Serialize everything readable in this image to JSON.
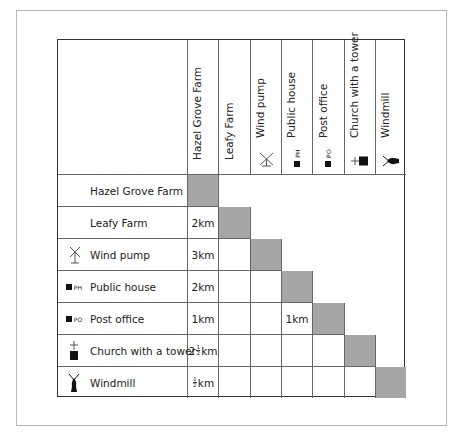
{
  "table": {
    "columns": [
      {
        "label": "Hazel Grove Farm",
        "icon": null
      },
      {
        "label": "Leafy Farm",
        "icon": null
      },
      {
        "label": "Wind pump",
        "icon": "wind-pump-icon"
      },
      {
        "label": "Public house",
        "icon": "public-house-icon",
        "icon_text": "PH"
      },
      {
        "label": "Post office",
        "icon": "post-office-icon",
        "icon_text": "PO"
      },
      {
        "label": "Church with a tower",
        "icon": "church-with-tower-icon"
      },
      {
        "label": "Windmill",
        "icon": "windmill-icon"
      }
    ],
    "rows": [
      {
        "label": "Hazel Grove Farm",
        "icon": null,
        "values": []
      },
      {
        "label": "Leafy Farm",
        "icon": null,
        "values": [
          "2km"
        ]
      },
      {
        "label": "Wind pump",
        "icon": "wind-pump-icon",
        "values": [
          "3km",
          ""
        ]
      },
      {
        "label": "Public house",
        "icon": "public-house-icon",
        "icon_text": "PH",
        "values": [
          "2km",
          "",
          ""
        ]
      },
      {
        "label": "Post office",
        "icon": "post-office-icon",
        "icon_text": "PO",
        "values": [
          "1km",
          "",
          "1km",
          ""
        ]
      },
      {
        "label": "Church with a tower",
        "icon": "church-with-tower-icon",
        "values": [
          "2½km",
          "",
          "",
          "",
          ""
        ]
      },
      {
        "label": "Windmill",
        "icon": "windmill-icon",
        "values": [
          "½km",
          "",
          "",
          "",
          "",
          ""
        ]
      }
    ],
    "shade_color": "#a6a6a6",
    "border_color": "#333333"
  },
  "labels": {
    "col0": "Hazel Grove Farm",
    "col1": "Leafy Farm",
    "col2": "Wind pump",
    "col3": "Public house",
    "col4": "Post office",
    "col5": "Church with a tower",
    "col6": "Windmill",
    "row0": "Hazel Grove Farm",
    "row1": "Leafy Farm",
    "row2": "Wind pump",
    "row3": "Public house",
    "row4": "Post office",
    "row5": "Church with a tower",
    "row6": "Windmill",
    "ph": "PH",
    "po": "PO"
  },
  "values": {
    "r1c0": "2km",
    "r2c0": "3km",
    "r3c0": "2km",
    "r4c0": "1km",
    "r4c2": "1km",
    "r5c0_whole": "2",
    "r5c0_num": "1",
    "r5c0_den": "2",
    "r5c0_unit": "km",
    "r6c0_num": "1",
    "r6c0_den": "2",
    "r6c0_unit": "km"
  }
}
